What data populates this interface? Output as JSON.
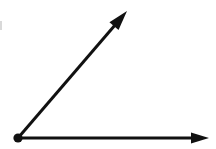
{
  "figure": {
    "type": "geometric-diagram",
    "canvas": {
      "width": 216,
      "height": 149,
      "background_color": "#ffffff"
    },
    "stroke_color": "#111111",
    "vertex": {
      "label": "",
      "x": 18,
      "y": 138,
      "radius": 4.6,
      "fill_color": "#111111"
    },
    "rays": [
      {
        "name": "upper-ray",
        "from_x": 18,
        "from_y": 138,
        "to_x": 127,
        "to_y": 11,
        "stroke_width": 3.0,
        "arrowhead": "filled-triangle",
        "arrow_length": 20,
        "arrow_half_width": 6.0
      },
      {
        "name": "horizontal-ray",
        "from_x": 18,
        "from_y": 138,
        "to_x": 209,
        "to_y": 138,
        "stroke_width": 3.0,
        "arrowhead": "filled-triangle",
        "arrow_length": 18,
        "arrow_half_width": 5.6
      }
    ],
    "edge_mark": {
      "name": "left-edge-speck",
      "x": 0,
      "y": 21,
      "width": 2,
      "height": 9,
      "color": "#b9b9b9"
    }
  }
}
